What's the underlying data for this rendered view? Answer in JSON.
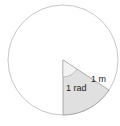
{
  "diagram": {
    "labels": {
      "radius": "1 m",
      "angle": "1 rad"
    },
    "colors": {
      "circle_stroke": "#c8c8c8",
      "sector_fill": "#e0e0e0",
      "arc_fill": "#f0f0f0",
      "line": "#999999",
      "text": "#222222"
    }
  }
}
